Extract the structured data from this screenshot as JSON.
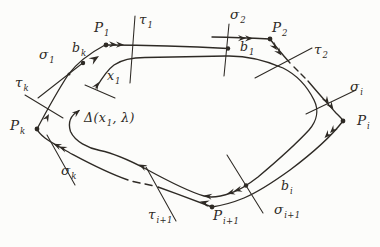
{
  "figure": {
    "colors": {
      "paper": "#fcfcfa",
      "ink": "#2e2a25"
    },
    "labels": {
      "P1": {
        "pre": "P",
        "sub": "1",
        "post": ""
      },
      "tau1": {
        "pre": "τ",
        "sub": "1",
        "post": ""
      },
      "sigma2": {
        "pre": "σ",
        "sub": "2",
        "post": ""
      },
      "P2": {
        "pre": "P",
        "sub": "2",
        "post": ""
      },
      "b1": {
        "pre": "b",
        "sub": "1",
        "post": ""
      },
      "tau2": {
        "pre": "τ",
        "sub": "2",
        "post": ""
      },
      "sigma_i": {
        "pre": "σ",
        "sub": "i",
        "post": ""
      },
      "P_i": {
        "pre": "P",
        "sub": "i",
        "post": ""
      },
      "b_k": {
        "pre": "b",
        "sub": "k",
        "post": ""
      },
      "sigma1": {
        "pre": "σ",
        "sub": "1",
        "post": ""
      },
      "x1": {
        "pre": "x",
        "sub": "1",
        "post": ""
      },
      "tau_k": {
        "pre": "τ",
        "sub": "k",
        "post": ""
      },
      "P_k": {
        "pre": "P",
        "sub": "k",
        "post": ""
      },
      "delta": {
        "pre": "Δ(x",
        "sub": "1",
        "post": ", λ)"
      },
      "sigma_k": {
        "pre": "σ",
        "sub": "k",
        "post": ""
      },
      "b_i": {
        "pre": "b",
        "sub": "i",
        "post": ""
      },
      "sigma_i1": {
        "pre": "σ",
        "sub": "i+1",
        "post": ""
      },
      "P_i1": {
        "pre": "P",
        "sub": "i+1",
        "post": ""
      },
      "tau_i1": {
        "pre": "τ",
        "sub": "i+1",
        "post": ""
      }
    }
  }
}
